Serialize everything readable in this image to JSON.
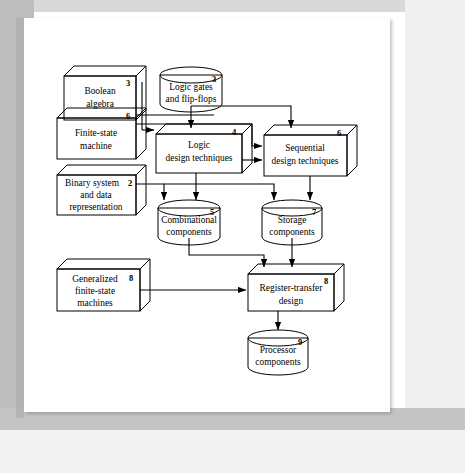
{
  "figure": {
    "colors": {
      "white_fill": "#ffffff",
      "gray_fill": "#c0c0c0",
      "gray_top_face": "#d6d6d6",
      "gray_side_face": "#a8a8a8",
      "dark_fill": "#8d8d8d",
      "dark_top": "#4a4a4a",
      "stroke": "#000000",
      "page_background": "#ffffff",
      "frame_gray": "#bdbdbd"
    },
    "nodes": [
      {
        "id": "boolean-algebra",
        "label_lines": [
          "Boolean",
          "algebra"
        ],
        "chapter": "3",
        "shape": "box3d",
        "fill": "white"
      },
      {
        "id": "logic-gates-flip-flops",
        "label_lines": [
          "Logic gates",
          "and flip-flops"
        ],
        "chapter": "3",
        "shape": "cylinder",
        "fill": "white"
      },
      {
        "id": "finite-state-machine",
        "label_lines": [
          "Finite-state",
          "machine"
        ],
        "chapter": "6",
        "shape": "box3d",
        "fill": "white"
      },
      {
        "id": "logic-design-techniques",
        "label_lines": [
          "Logic",
          "design techniques"
        ],
        "chapter": "4",
        "shape": "box3d",
        "fill": "white"
      },
      {
        "id": "sequential-design-techniques",
        "label_lines": [
          "Sequential",
          "design techniques"
        ],
        "chapter": "6",
        "shape": "box3d",
        "fill": "white"
      },
      {
        "id": "binary-system-data-representation",
        "label_lines": [
          "Binary system",
          "and data",
          "representation"
        ],
        "chapter": "2",
        "shape": "box3d",
        "fill": "white"
      },
      {
        "id": "combinational-components",
        "label_lines": [
          "Combinational",
          "components"
        ],
        "chapter": "5",
        "shape": "cylinder",
        "fill": "white"
      },
      {
        "id": "storage-components",
        "label_lines": [
          "Storage",
          "components"
        ],
        "chapter": "7",
        "shape": "cylinder",
        "fill": "white"
      },
      {
        "id": "generalized-finite-state-machines",
        "label_lines": [
          "Generalized",
          "finite-state",
          "machines"
        ],
        "chapter": "8",
        "shape": "box3d",
        "fill": "gray"
      },
      {
        "id": "register-transfer-design",
        "label_lines": [
          "Register-transfer",
          "design"
        ],
        "chapter": "8",
        "shape": "box3d",
        "fill": "gray"
      },
      {
        "id": "processor-components",
        "label_lines": [
          "Processor",
          "components"
        ],
        "chapter": "9",
        "shape": "cylinder",
        "fill": "dark"
      }
    ],
    "edges": [
      {
        "from": "boolean-algebra",
        "to": "logic-design-techniques"
      },
      {
        "from": "logic-gates-flip-flops",
        "to": "logic-design-techniques"
      },
      {
        "from": "logic-gates-flip-flops",
        "to": "sequential-design-techniques"
      },
      {
        "from": "finite-state-machine",
        "to": "logic-design-techniques"
      },
      {
        "from": "finite-state-machine",
        "to": "sequential-design-techniques"
      },
      {
        "from": "logic-design-techniques",
        "to": "sequential-design-techniques"
      },
      {
        "from": "logic-design-techniques",
        "to": "combinational-components"
      },
      {
        "from": "binary-system-data-representation",
        "to": "combinational-components"
      },
      {
        "from": "binary-system-data-representation",
        "to": "storage-components"
      },
      {
        "from": "sequential-design-techniques",
        "to": "storage-components"
      },
      {
        "from": "combinational-components",
        "to": "register-transfer-design"
      },
      {
        "from": "storage-components",
        "to": "register-transfer-design"
      },
      {
        "from": "generalized-finite-state-machines",
        "to": "register-transfer-design"
      },
      {
        "from": "register-transfer-design",
        "to": "processor-components"
      }
    ]
  }
}
